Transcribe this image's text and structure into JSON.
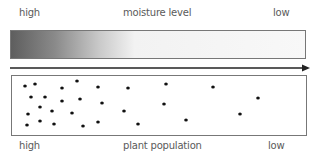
{
  "moisture_scale": {
    "high_label": "high",
    "title": "moisture level",
    "low_label": "low",
    "gradient_colors": [
      "#5e5e5e",
      "#f8f8f8"
    ]
  },
  "arrow": {
    "direction": "right",
    "color": "#222222"
  },
  "population_panel": {
    "high_label": "high",
    "title": "plant population",
    "low_label": "low",
    "dot_color": "#111111",
    "dots": [
      [
        25,
        86
      ],
      [
        35,
        84
      ],
      [
        62,
        88
      ],
      [
        77,
        81
      ],
      [
        31,
        97
      ],
      [
        45,
        97
      ],
      [
        62,
        101
      ],
      [
        40,
        107
      ],
      [
        52,
        111
      ],
      [
        72,
        113
      ],
      [
        28,
        114
      ],
      [
        40,
        121
      ],
      [
        54,
        124
      ],
      [
        27,
        125
      ],
      [
        98,
        87
      ],
      [
        128,
        88
      ],
      [
        80,
        99
      ],
      [
        102,
        103
      ],
      [
        124,
        111
      ],
      [
        83,
        126
      ],
      [
        98,
        122
      ],
      [
        138,
        124
      ],
      [
        166,
        84
      ],
      [
        164,
        104
      ],
      [
        186,
        120
      ],
      [
        213,
        87
      ],
      [
        258,
        98
      ],
      [
        240,
        114
      ]
    ]
  }
}
